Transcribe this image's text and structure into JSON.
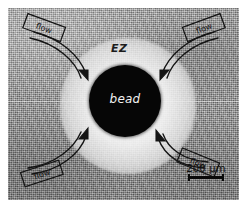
{
  "figure": {
    "kind": "optical-micrograph",
    "background_color": "#ffffff",
    "plate_color": "#9d9d9d"
  },
  "labels": {
    "exclusion_zone": "EZ",
    "bead": "bead"
  },
  "flow_arrows": [
    {
      "id": "top-left",
      "label": "flow"
    },
    {
      "id": "top-right",
      "label": "flow"
    },
    {
      "id": "bottom-left",
      "label": "flow"
    },
    {
      "id": "bottom-right",
      "label": "flow"
    }
  ],
  "scale_bar": {
    "label": "200 µm",
    "value": 200,
    "unit": "µm"
  },
  "colors": {
    "bead": "#060606",
    "ez_halo": "#f5f5f5",
    "ink": "#111111",
    "bead_text": "#f2f2f2"
  }
}
